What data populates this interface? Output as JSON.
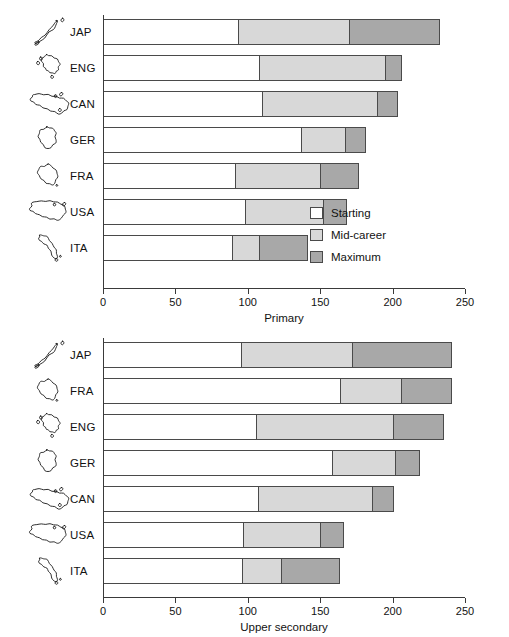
{
  "figure": {
    "background": "#ffffff",
    "colors": {
      "starting": "#ffffff",
      "mid_career": "#d8d8d8",
      "maximum": "#a8a8a8",
      "outline": "#4a4a4a",
      "axis": "#3a3a3a",
      "text": "#121212"
    }
  },
  "legend": {
    "position": "inside-right-of-primary-panel",
    "items": [
      {
        "key": "starting",
        "label": "Starting"
      },
      {
        "key": "mid_career",
        "label": "Mid-career"
      },
      {
        "key": "maximum",
        "label": "Maximum"
      }
    ]
  },
  "chart_data": [
    {
      "id": "primary",
      "type": "bar",
      "orientation": "horizontal",
      "stacked": "cumulative-thresholds",
      "title": "",
      "xlabel": "Primary",
      "ylabel": "",
      "xlim": [
        0,
        250
      ],
      "xticks": [
        0,
        50,
        100,
        150,
        200,
        250
      ],
      "xtick_labels": [
        "0",
        "50",
        "100",
        "150",
        "200",
        "250"
      ],
      "grid": false,
      "legend_position": "center-right",
      "categories": [
        "JAP",
        "ENG",
        "CAN",
        "GER",
        "FRA",
        "USA",
        "ITA"
      ],
      "series": [
        {
          "name": "Starting",
          "key": "starting",
          "values": [
            93,
            108,
            110,
            137,
            91,
            98,
            89
          ]
        },
        {
          "name": "Mid-career",
          "key": "mid_career",
          "values": [
            170,
            195,
            189,
            167,
            150,
            152,
            108
          ]
        },
        {
          "name": "Maximum",
          "key": "maximum",
          "values": [
            232,
            206,
            203,
            181,
            176,
            168,
            141
          ]
        }
      ]
    },
    {
      "id": "upper_secondary",
      "type": "bar",
      "orientation": "horizontal",
      "stacked": "cumulative-thresholds",
      "title": "",
      "xlabel": "Upper secondary",
      "ylabel": "",
      "xlim": [
        0,
        250
      ],
      "xticks": [
        0,
        50,
        100,
        150,
        200,
        250
      ],
      "xtick_labels": [
        "0",
        "50",
        "100",
        "150",
        "200",
        "250"
      ],
      "grid": false,
      "legend_position": "none",
      "categories": [
        "JAP",
        "FRA",
        "ENG",
        "GER",
        "CAN",
        "USA",
        "ITA"
      ],
      "series": [
        {
          "name": "Starting",
          "key": "starting",
          "values": [
            95,
            164,
            106,
            158,
            107,
            97,
            96
          ]
        },
        {
          "name": "Mid-career",
          "key": "mid_career",
          "values": [
            172,
            206,
            200,
            202,
            186,
            150,
            123
          ]
        },
        {
          "name": "Maximum",
          "key": "maximum",
          "values": [
            240,
            240,
            235,
            218,
            200,
            166,
            163
          ]
        }
      ]
    }
  ],
  "country_icons": {
    "JAP": "japan-map-icon",
    "ENG": "united-kingdom-map-icon",
    "CAN": "canada-map-icon",
    "GER": "germany-map-icon",
    "FRA": "france-map-icon",
    "USA": "united-states-map-icon",
    "ITA": "italy-map-icon"
  }
}
